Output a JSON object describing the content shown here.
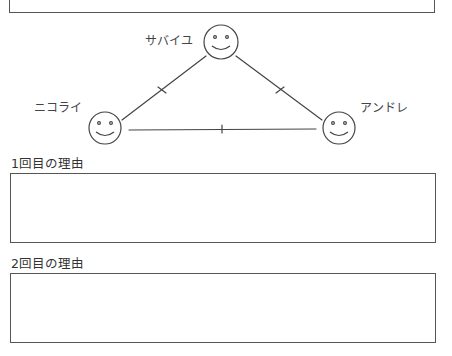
{
  "diagram": {
    "people": [
      {
        "id": "sabaiyu",
        "name": "サバイユ",
        "cx": 221,
        "cy": 42,
        "r": 17
      },
      {
        "id": "nikolai",
        "name": "ニコライ",
        "cx": 105,
        "cy": 128,
        "r": 16
      },
      {
        "id": "andre",
        "name": "アンドレ",
        "cx": 339,
        "cy": 128,
        "r": 16
      }
    ],
    "edges": [
      {
        "from": "sabaiyu",
        "to": "nikolai",
        "tick": true
      },
      {
        "from": "sabaiyu",
        "to": "andre",
        "tick": true
      },
      {
        "from": "nikolai",
        "to": "andre",
        "tick": true
      }
    ],
    "line_color": "#444444"
  },
  "answers": [
    {
      "label": "1回目の理由",
      "value": ""
    },
    {
      "label": "2回目の理由",
      "value": ""
    }
  ]
}
